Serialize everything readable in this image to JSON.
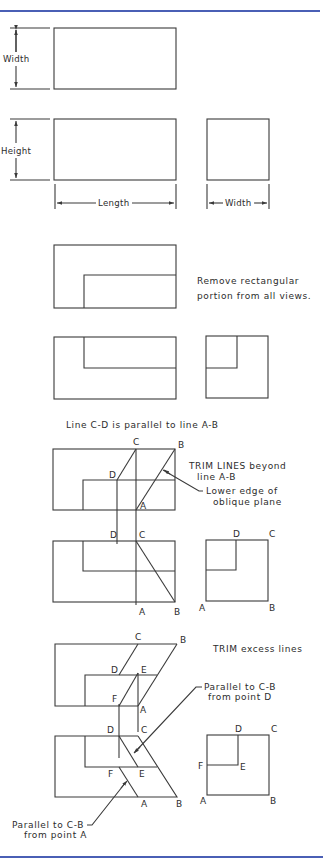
{
  "colors": {
    "rule": "#4a5fb5",
    "ink": "#3a3a3a",
    "background": "#ffffff"
  },
  "step1": {
    "dim_label": "Width"
  },
  "step2": {
    "height_label": "Height",
    "length_label": "Length",
    "width_label": "Width"
  },
  "step3": {
    "note_line1": "Remove rectangular",
    "note_line2": "portion from all views."
  },
  "step4": {
    "caption": "Line C-D is parallel to line A-B",
    "note_trim_line1": "TRIM LINES beyond",
    "note_trim_line2": "line A-B",
    "note_edge_line1": "Lower edge of",
    "note_edge_line2": "oblique plane",
    "top_points": {
      "C": "C",
      "B": "B",
      "D": "D",
      "A": "A"
    },
    "front_points": {
      "D": "D",
      "C": "C",
      "A": "A",
      "B": "B"
    },
    "side_points": {
      "D": "D",
      "C": "C",
      "A": "A",
      "B": "B"
    }
  },
  "step5": {
    "note_trim": "TRIM excess lines",
    "note_d_line1": "Parallel to C-B",
    "note_d_line2": "from point D",
    "note_a_line1": "Parallel to C-B",
    "note_a_line2": "from point A",
    "top_points": {
      "C": "C",
      "B": "B",
      "D": "D",
      "E": "E",
      "F": "F",
      "A": "A"
    },
    "front_points": {
      "D": "D",
      "C": "C",
      "F": "F",
      "E": "E",
      "A": "A",
      "B": "B"
    },
    "side_points": {
      "D": "D",
      "C": "C",
      "F": "F",
      "E": "E",
      "A": "A",
      "B": "B"
    }
  }
}
